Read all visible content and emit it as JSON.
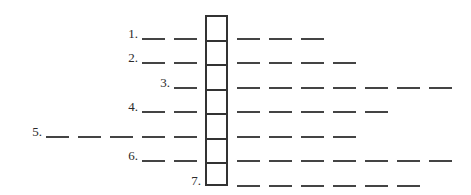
{
  "puzzle": {
    "type": "word-ladder-crossword",
    "column_cells": 7,
    "rows": [
      {
        "label": "1.",
        "left_blanks": 2,
        "right_blanks": 3
      },
      {
        "label": "2.",
        "left_blanks": 2,
        "right_blanks": 4
      },
      {
        "label": "3.",
        "left_blanks": 1,
        "right_blanks": 7
      },
      {
        "label": "4.",
        "left_blanks": 2,
        "right_blanks": 5
      },
      {
        "label": "5.",
        "left_blanks": 5,
        "right_blanks": 4
      },
      {
        "label": "6.",
        "left_blanks": 2,
        "right_blanks": 7
      },
      {
        "label": "7.",
        "left_blanks": 0,
        "right_blanks": 6
      }
    ]
  }
}
